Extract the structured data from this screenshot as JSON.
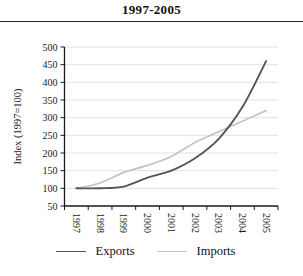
{
  "page": {
    "title": "1997-2005"
  },
  "chart_data": {
    "type": "line",
    "title": "1997-2005",
    "ylabel": "Index (1997=100)",
    "xlabel": "",
    "ylim": [
      50,
      500
    ],
    "yticks": [
      50,
      100,
      150,
      200,
      250,
      300,
      350,
      400,
      450,
      500
    ],
    "x_categories": [
      "1997",
      "1998",
      "1999",
      "2000",
      "2001",
      "2002",
      "2003",
      "2004",
      "2005"
    ],
    "series": [
      {
        "name": "Exports",
        "color": "#555555",
        "line_width": 1.9,
        "values": [
          100,
          100,
          105,
          130,
          150,
          185,
          240,
          330,
          460
        ]
      },
      {
        "name": "Imports",
        "color": "#c3c3c3",
        "line_width": 1.7,
        "values": [
          100,
          115,
          145,
          165,
          190,
          230,
          260,
          290,
          320
        ]
      }
    ],
    "grid": true,
    "gridline_color": "#dadada",
    "axis_color": "#1a1a1a",
    "legend_position": "bottom",
    "smoothed": true
  }
}
